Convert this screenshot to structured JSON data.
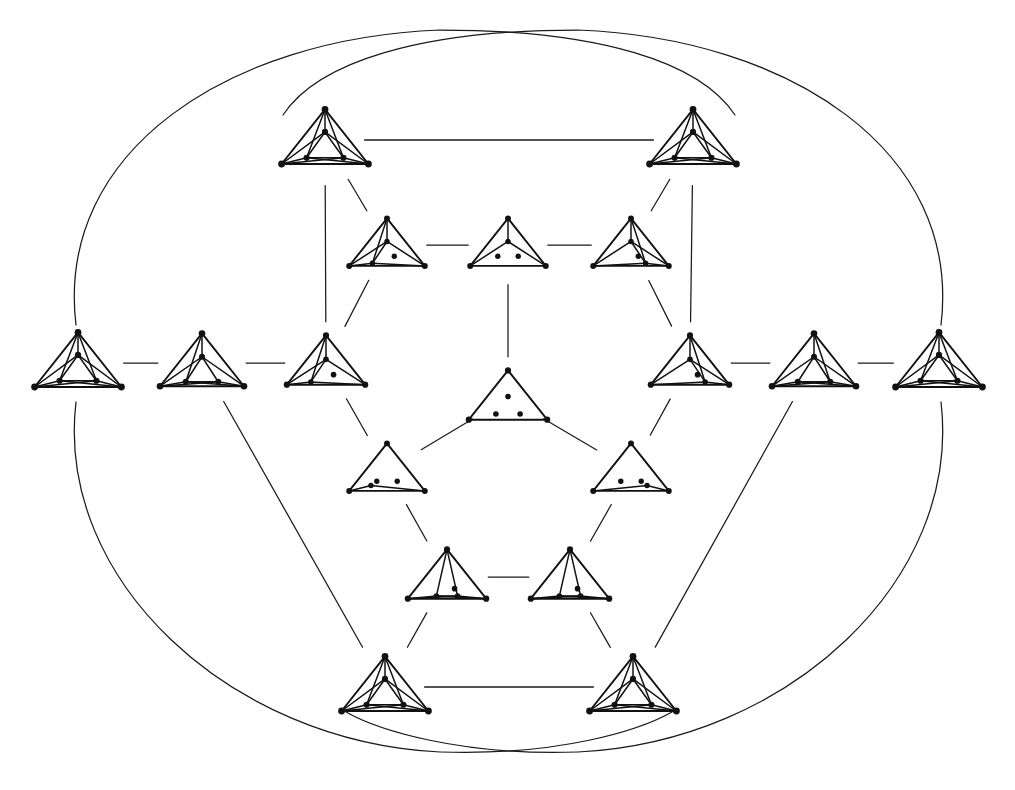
{
  "figure": {
    "kind": "hasse-diagram",
    "background_color": "#ffffff",
    "ink_color": "#111111",
    "width": 1015,
    "height": 790,
    "node_count": 18,
    "cover_edge_count": 27,
    "outer_arc_count": 4
  },
  "chart_data": {
    "type": "diagram",
    "xlabel": "",
    "ylabel": "",
    "legend": [],
    "annotations": [],
    "nodes": [
      {
        "id": "TL",
        "label": "top-left",
        "x": 325,
        "y": 140,
        "size": 62,
        "tri_edges": 3,
        "inner": [
          {
            "x": 0.0,
            "y": -0.1,
            "deg": 3
          },
          {
            "x": -0.22,
            "y": 0.22,
            "deg": 3
          },
          {
            "x": 0.22,
            "y": 0.22,
            "deg": 3
          }
        ],
        "dots": 0,
        "density": "dense"
      },
      {
        "id": "TR",
        "label": "top-right",
        "x": 693,
        "y": 140,
        "size": 62,
        "tri_edges": 3,
        "inner": [
          {
            "x": 0.0,
            "y": -0.1,
            "deg": 3
          },
          {
            "x": -0.22,
            "y": 0.22,
            "deg": 3
          },
          {
            "x": 0.22,
            "y": 0.22,
            "deg": 3
          }
        ],
        "dots": 0,
        "density": "dense"
      },
      {
        "id": "UL",
        "label": "upper-left-inner",
        "x": 387,
        "y": 245,
        "size": 54,
        "tri_edges": 3,
        "inner": [
          {
            "x": 0.0,
            "y": -0.05,
            "deg": 3
          },
          {
            "x": -0.2,
            "y": 0.26,
            "deg": 3
          }
        ],
        "dots": 1,
        "density": "medium"
      },
      {
        "id": "UC",
        "label": "upper-center",
        "x": 508,
        "y": 245,
        "size": 54,
        "tri_edges": 3,
        "inner": [
          {
            "x": 0.0,
            "y": -0.05,
            "deg": 3
          }
        ],
        "dots": 2,
        "density": "light"
      },
      {
        "id": "UR",
        "label": "upper-right-inner",
        "x": 631,
        "y": 245,
        "size": 54,
        "tri_edges": 3,
        "inner": [
          {
            "x": 0.0,
            "y": -0.05,
            "deg": 3
          },
          {
            "x": 0.2,
            "y": 0.26,
            "deg": 3
          }
        ],
        "dots": 1,
        "density": "medium"
      },
      {
        "id": "L1",
        "label": "far-left",
        "x": 78,
        "y": 363,
        "size": 62,
        "tri_edges": 3,
        "inner": [
          {
            "x": 0.0,
            "y": -0.1,
            "deg": 3
          },
          {
            "x": -0.22,
            "y": 0.22,
            "deg": 3
          },
          {
            "x": 0.22,
            "y": 0.22,
            "deg": 3
          }
        ],
        "dots": 0,
        "density": "dense"
      },
      {
        "id": "L2",
        "label": "left-second",
        "x": 202,
        "y": 363,
        "size": 60,
        "tri_edges": 3,
        "inner": [
          {
            "x": 0.0,
            "y": -0.08,
            "deg": 3
          },
          {
            "x": -0.2,
            "y": 0.24,
            "deg": 3
          },
          {
            "x": 0.2,
            "y": 0.24,
            "deg": 2
          }
        ],
        "dots": 0,
        "density": "dense"
      },
      {
        "id": "L3",
        "label": "left-third",
        "x": 326,
        "y": 363,
        "size": 56,
        "tri_edges": 3,
        "inner": [
          {
            "x": 0.0,
            "y": -0.05,
            "deg": 3
          },
          {
            "x": -0.2,
            "y": 0.26,
            "deg": 3
          }
        ],
        "dots": 1,
        "density": "medium"
      },
      {
        "id": "C",
        "label": "center",
        "x": 508,
        "y": 398,
        "size": 56,
        "tri_edges": 3,
        "inner": [],
        "dots": 3,
        "density": "empty"
      },
      {
        "id": "R3",
        "label": "right-third",
        "x": 690,
        "y": 363,
        "size": 56,
        "tri_edges": 3,
        "inner": [
          {
            "x": 0.0,
            "y": -0.05,
            "deg": 3
          },
          {
            "x": 0.2,
            "y": 0.26,
            "deg": 3
          }
        ],
        "dots": 1,
        "density": "medium"
      },
      {
        "id": "R2",
        "label": "right-second",
        "x": 814,
        "y": 363,
        "size": 60,
        "tri_edges": 3,
        "inner": [
          {
            "x": 0.0,
            "y": -0.08,
            "deg": 3
          },
          {
            "x": -0.2,
            "y": 0.24,
            "deg": 2
          },
          {
            "x": 0.2,
            "y": 0.24,
            "deg": 3
          }
        ],
        "dots": 0,
        "density": "dense"
      },
      {
        "id": "R1",
        "label": "far-right",
        "x": 939,
        "y": 363,
        "size": 62,
        "tri_edges": 3,
        "inner": [
          {
            "x": 0.0,
            "y": -0.1,
            "deg": 3
          },
          {
            "x": -0.22,
            "y": 0.22,
            "deg": 3
          },
          {
            "x": 0.22,
            "y": 0.22,
            "deg": 3
          }
        ],
        "dots": 0,
        "density": "dense"
      },
      {
        "id": "ML",
        "label": "mid-lower-left",
        "x": 387,
        "y": 470,
        "size": 54,
        "tri_edges": 3,
        "inner": [
          {
            "x": -0.22,
            "y": 0.22,
            "deg": 2
          }
        ],
        "dots": 2,
        "density": "light"
      },
      {
        "id": "MR",
        "label": "mid-lower-right",
        "x": 631,
        "y": 470,
        "size": 54,
        "tri_edges": 3,
        "inner": [
          {
            "x": 0.22,
            "y": 0.22,
            "deg": 2
          }
        ],
        "dots": 2,
        "density": "light"
      },
      {
        "id": "BL",
        "label": "bottom-inner-left",
        "x": 447,
        "y": 577,
        "size": 56,
        "tri_edges": 3,
        "inner": [
          {
            "x": -0.14,
            "y": 0.26,
            "deg": 3
          },
          {
            "x": 0.14,
            "y": 0.26,
            "deg": 3
          }
        ],
        "dots": 1,
        "density": "medium"
      },
      {
        "id": "BR",
        "label": "bottom-inner-right",
        "x": 570,
        "y": 577,
        "size": 56,
        "tri_edges": 3,
        "inner": [
          {
            "x": -0.14,
            "y": 0.26,
            "deg": 3
          },
          {
            "x": 0.14,
            "y": 0.26,
            "deg": 3
          }
        ],
        "dots": 1,
        "density": "medium"
      },
      {
        "id": "BBL",
        "label": "bottom-left",
        "x": 385,
        "y": 687,
        "size": 62,
        "tri_edges": 3,
        "inner": [
          {
            "x": 0.0,
            "y": -0.1,
            "deg": 3
          },
          {
            "x": -0.22,
            "y": 0.22,
            "deg": 3
          },
          {
            "x": 0.22,
            "y": 0.22,
            "deg": 3
          }
        ],
        "dots": 0,
        "density": "dense"
      },
      {
        "id": "BBR",
        "label": "bottom-right",
        "x": 633,
        "y": 687,
        "size": 62,
        "tri_edges": 3,
        "inner": [
          {
            "x": 0.0,
            "y": -0.1,
            "deg": 3
          },
          {
            "x": -0.22,
            "y": 0.22,
            "deg": 3
          },
          {
            "x": 0.22,
            "y": 0.22,
            "deg": 3
          }
        ],
        "dots": 0,
        "density": "dense"
      }
    ],
    "cover_edges": [
      {
        "from": "TL",
        "to": "TR",
        "style": "straight-long"
      },
      {
        "from": "TL",
        "to": "L3",
        "style": "straight"
      },
      {
        "from": "TL",
        "to": "UL",
        "style": "straight"
      },
      {
        "from": "TR",
        "to": "UR",
        "style": "straight"
      },
      {
        "from": "TR",
        "to": "R3",
        "style": "straight"
      },
      {
        "from": "UL",
        "to": "UC",
        "style": "straight"
      },
      {
        "from": "UC",
        "to": "UR",
        "style": "straight"
      },
      {
        "from": "UL",
        "to": "L3",
        "style": "straight"
      },
      {
        "from": "UR",
        "to": "R3",
        "style": "straight"
      },
      {
        "from": "UC",
        "to": "C",
        "style": "straight"
      },
      {
        "from": "L1",
        "to": "L2",
        "style": "straight"
      },
      {
        "from": "L2",
        "to": "L3",
        "style": "straight"
      },
      {
        "from": "R3",
        "to": "R2",
        "style": "straight"
      },
      {
        "from": "R2",
        "to": "R1",
        "style": "straight"
      },
      {
        "from": "L3",
        "to": "ML",
        "style": "straight"
      },
      {
        "from": "R3",
        "to": "MR",
        "style": "straight"
      },
      {
        "from": "C",
        "to": "ML",
        "style": "straight"
      },
      {
        "from": "C",
        "to": "MR",
        "style": "straight"
      },
      {
        "from": "ML",
        "to": "BL",
        "style": "straight"
      },
      {
        "from": "MR",
        "to": "BR",
        "style": "straight"
      },
      {
        "from": "BL",
        "to": "BR",
        "style": "straight"
      },
      {
        "from": "BL",
        "to": "BBL",
        "style": "straight"
      },
      {
        "from": "BR",
        "to": "BBR",
        "style": "straight"
      },
      {
        "from": "BBL",
        "to": "BBR",
        "style": "straight-long"
      },
      {
        "from": "L2",
        "to": "BBL",
        "style": "straight"
      },
      {
        "from": "R2",
        "to": "BBR",
        "style": "straight"
      },
      {
        "from": "TL",
        "to": "TR",
        "style": "crossing-top"
      }
    ],
    "outer_arcs": [
      {
        "name": "left-outer-arc",
        "from": "L1",
        "to": "TR",
        "side": "top-left"
      },
      {
        "name": "right-outer-arc",
        "from": "R1",
        "to": "TL",
        "side": "top-right"
      },
      {
        "name": "left-lower-arc",
        "from": "L1",
        "to": "BBR",
        "side": "bottom-left"
      },
      {
        "name": "right-lower-arc",
        "from": "R1",
        "to": "BBL",
        "side": "bottom-right"
      }
    ]
  },
  "glyphs": {
    "node_icon": "graph-triangle-icon",
    "edge_icon": "cover-relation-line",
    "arc_icon": "outer-arc-curve"
  }
}
